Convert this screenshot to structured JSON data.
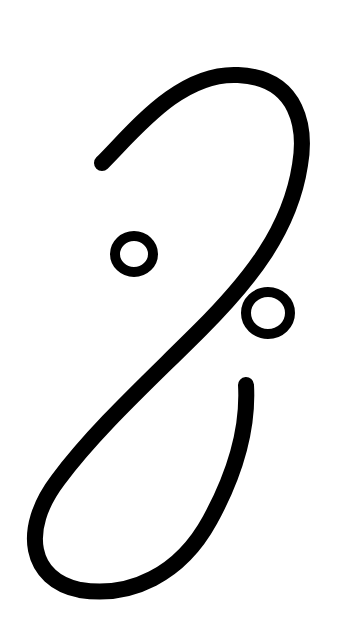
{
  "figure": {
    "description": "Black calligraphic glyph: an S / integral-like stroke with two small open circles",
    "colors": {
      "background": "#ffffff",
      "ink": "#000000"
    },
    "elements": [
      {
        "name": "main-stroke",
        "type": "stroke"
      },
      {
        "name": "circle-upper-left",
        "type": "open-circle"
      },
      {
        "name": "circle-right",
        "type": "open-circle"
      }
    ]
  }
}
